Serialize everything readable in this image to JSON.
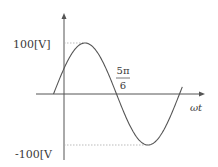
{
  "chart_data": {
    "type": "line",
    "title": "",
    "xlabel": "ωt",
    "ylabel": "",
    "function": "v = 100 sin(ωt + π/6)",
    "amplitude": 100,
    "unit": "V",
    "phase_offset_rad": 0.5235987756,
    "x_range_rad": [
      -0.5235987756,
      5.9
    ],
    "y_range": [
      -100,
      100
    ],
    "grid": false,
    "legend": "none",
    "series": [
      {
        "name": "v(ωt)",
        "x": [
          -0.5236,
          0,
          0.5236,
          1.0472,
          1.5708,
          2.0944,
          2.618,
          3.1416,
          3.6652,
          4.1888,
          4.7124,
          5.236,
          5.7596
        ],
        "values": [
          0,
          50,
          86.6,
          100,
          86.6,
          50,
          0,
          -50,
          -86.6,
          -100,
          -86.6,
          -50,
          0
        ]
      }
    ],
    "annotations": {
      "y_max_label": "100[V]",
      "y_min_label": "-100[V",
      "zero_crossing_numerator": "5π",
      "zero_crossing_denominator": "6",
      "zero_crossing_value_rad": 2.617993878
    },
    "colors": {
      "axis": "#555555",
      "curve": "#555555",
      "guide": "#aaaaaa",
      "text": "#3a3a3a"
    }
  }
}
